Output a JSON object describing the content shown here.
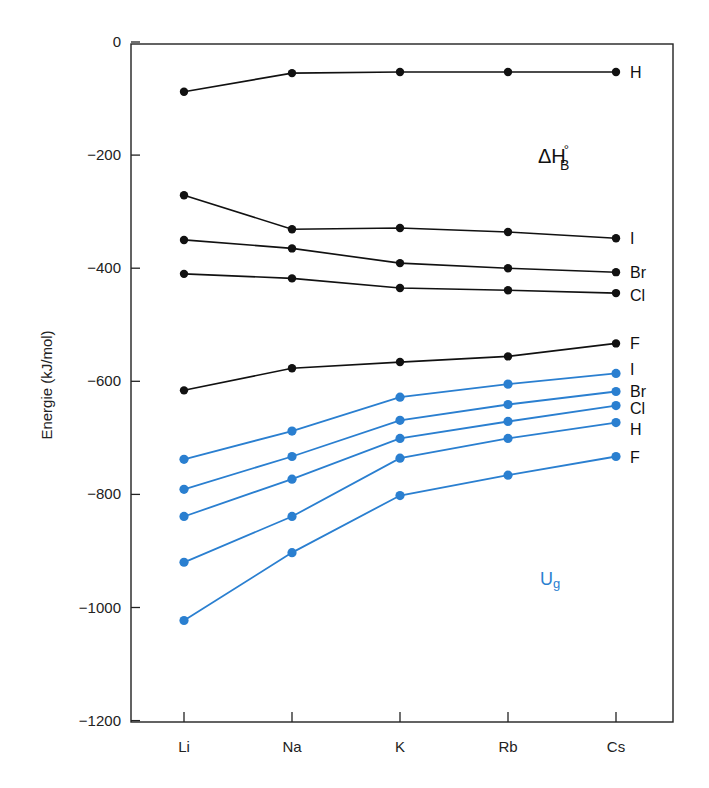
{
  "chart_data": {
    "type": "line",
    "title": "",
    "xlabel": "",
    "ylabel": "Energie (kJ/mol)",
    "categories": [
      "Li",
      "Na",
      "K",
      "Rb",
      "Cs"
    ],
    "ylim": [
      -1200,
      0
    ],
    "yticks": [
      0,
      -200,
      -400,
      -600,
      -800,
      -1000,
      -1200
    ],
    "ytick_labels": [
      "0",
      "−200",
      "−400",
      "−600",
      "−800",
      "−1000",
      "−1200"
    ],
    "grid": false,
    "legend": "none (series labeled at right end of lines)",
    "groups": [
      {
        "name": "ΔH°B",
        "label_main": "ΔH",
        "label_sub": "B",
        "label_sup": "°",
        "color": "#111111",
        "series": [
          {
            "name": "H",
            "values": [
              -88,
              -55,
              -53,
              -53,
              -53
            ]
          },
          {
            "name": "I",
            "values": [
              -271,
              -331,
              -329,
              -336,
              -347
            ]
          },
          {
            "name": "Br",
            "values": [
              -350,
              -365,
              -391,
              -400,
              -407
            ]
          },
          {
            "name": "Cl",
            "values": [
              -410,
              -418,
              -435,
              -439,
              -444
            ]
          },
          {
            "name": "F",
            "values": [
              -616,
              -577,
              -566,
              -556,
              -533
            ]
          }
        ]
      },
      {
        "name": "Ug",
        "label_main": "U",
        "label_sub": "g",
        "color": "#2a7fd0",
        "series": [
          {
            "name": "I",
            "values": [
              -738,
              -688,
              -628,
              -605,
              -586
            ]
          },
          {
            "name": "Br",
            "values": [
              -791,
              -733,
              -669,
              -641,
              -618
            ]
          },
          {
            "name": "Cl",
            "values": [
              -839,
              -773,
              -701,
              -671,
              -643
            ]
          },
          {
            "name": "H",
            "values": [
              -920,
              -839,
              -736,
              -701,
              -673
            ]
          },
          {
            "name": "F",
            "values": [
              -1023,
              -903,
              -802,
              -766,
              -733
            ]
          }
        ]
      }
    ],
    "label_offsets": {
      "black": {
        "H": 0,
        "I": 0,
        "Br": 0,
        "Cl": 2,
        "F": 0
      },
      "blue": {
        "I": -4,
        "Br": 0,
        "Cl": 2,
        "H": 6,
        "F": 0
      }
    }
  }
}
